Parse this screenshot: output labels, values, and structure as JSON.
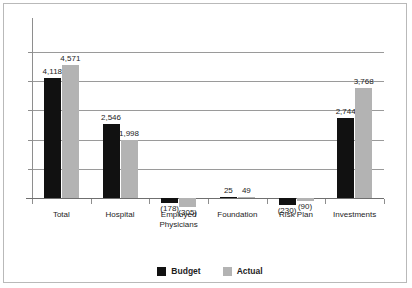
{
  "chart_data": {
    "type": "bar",
    "title": "",
    "subtitle": "",
    "xlabel": "",
    "ylabel": "",
    "orientation": "vertical",
    "grouping": "grouped",
    "grid": true,
    "grid_axis": "y",
    "y_tick_labels_shown": false,
    "ylim": [
      -1000,
      5000
    ],
    "y_gridline_values": [
      -1000,
      0,
      1000,
      2000,
      3000,
      4000,
      5000
    ],
    "y_gridlines_visible": [
      1000,
      2000,
      3000,
      4000,
      5000
    ],
    "zero_baseline": 0,
    "legend_position": "bottom-center",
    "negative_format": "parentheses",
    "categories": [
      "Total",
      "Employed\nPhysicians",
      "Hospital",
      "Foundation",
      "Risk Plan",
      "Investments"
    ],
    "category_order": [
      "Total",
      "Hospital",
      "Employed Physicians",
      "Foundation",
      "Risk Plan",
      "Investments"
    ],
    "series": [
      {
        "name": "Budget",
        "color": "#111111",
        "values": [
          4118,
          2546,
          -178,
          25,
          -230,
          2744
        ],
        "labels": [
          "4,118",
          "2,546",
          "(178)",
          "25",
          "(230)",
          "2,744"
        ]
      },
      {
        "name": "Actual",
        "color": "#b3b3b3",
        "values": [
          4571,
          1998,
          -305,
          49,
          -90,
          3768
        ],
        "labels": [
          "4,571",
          "1,998",
          "(305)",
          "49",
          "(90)",
          "3,768"
        ]
      }
    ]
  },
  "categories": [
    {
      "line1": "Total",
      "line2": ""
    },
    {
      "line1": "Hospital",
      "line2": ""
    },
    {
      "line1": "Employed",
      "line2": "Physicians"
    },
    {
      "line1": "Foundation",
      "line2": ""
    },
    {
      "line1": "Risk Plan",
      "line2": ""
    },
    {
      "line1": "Investments",
      "line2": ""
    }
  ],
  "legend": {
    "items": [
      {
        "label": "Budget",
        "color": "#111111"
      },
      {
        "label": "Actual",
        "color": "#b3b3b3"
      }
    ]
  },
  "colors": {
    "budget": "#111111",
    "actual": "#b3b3b3",
    "gridline": "#9a9a9a",
    "axis": "#8e8e8e",
    "border": "#b9b9b9",
    "text": "#1d1d1d",
    "background": "#ffffff"
  }
}
